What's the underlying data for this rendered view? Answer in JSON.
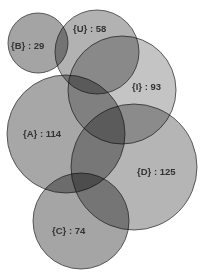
{
  "diagram": {
    "type": "euler-venn",
    "sets": [
      {
        "id": "B",
        "label": "{B} : 29",
        "name": "B",
        "count": 29,
        "cx": 38,
        "cy": 43,
        "r": 30,
        "color": "#8a8a8a",
        "label_x": 11,
        "label_y": 49
      },
      {
        "id": "U",
        "label": "{U} : 58",
        "name": "U",
        "count": 58,
        "cx": 97,
        "cy": 52,
        "r": 42,
        "color": "#9c9c9c",
        "label_x": 73,
        "label_y": 32
      },
      {
        "id": "I",
        "label": "{I} : 93",
        "name": "I",
        "count": 93,
        "cx": 122,
        "cy": 90,
        "r": 54,
        "color": "#b4b4b4",
        "label_x": 132,
        "label_y": 90
      },
      {
        "id": "A",
        "label": "{A} : 114",
        "name": "A",
        "count": 114,
        "cx": 66,
        "cy": 134,
        "r": 59,
        "color": "#8e8e8e",
        "label_x": 23,
        "label_y": 137
      },
      {
        "id": "D",
        "label": "{D} : 125",
        "name": "D",
        "count": 125,
        "cx": 134,
        "cy": 167,
        "r": 63,
        "color": "#a0a0a0",
        "label_x": 137,
        "label_y": 175
      },
      {
        "id": "C",
        "label": "{C} : 74",
        "name": "C",
        "count": 74,
        "cx": 81,
        "cy": 221,
        "r": 48,
        "color": "#8c8c8c",
        "label_x": 52,
        "label_y": 234
      }
    ]
  }
}
